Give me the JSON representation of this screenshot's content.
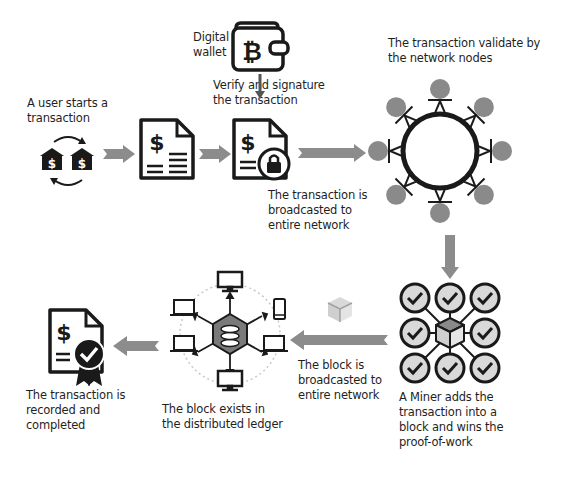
{
  "colors": {
    "arrow": "#8c8c8c",
    "icon_stroke": "#1a1a1a",
    "node_fill": "#8a8a8a",
    "check_fill": "#d9d9d9",
    "cube_fill": "#bfbfbf",
    "ledger_hex": "#7a7a7a",
    "dotted_ring": "#c8c8c8"
  },
  "steps": [
    {
      "id": "start",
      "label": "A user starts a\ntransaction",
      "icon": "bank-exchange-icon"
    },
    {
      "id": "invoice",
      "icon": "invoice-document-icon"
    },
    {
      "id": "signed",
      "icon": "locked-document-icon"
    },
    {
      "id": "wallet",
      "label": "Digital\nwallet",
      "icon": "bitcoin-wallet-icon"
    },
    {
      "id": "verify",
      "label": "Verify and signature\nthe transaction"
    },
    {
      "id": "broadcast_tx",
      "label": "The transaction is\nbroadcasted to\nentire network"
    },
    {
      "id": "validate",
      "label": "The transaction validate by\nthe network nodes",
      "icon": "network-ring-icon"
    },
    {
      "id": "miner",
      "label": "A Miner adds the\ntransaction into a\nblock and wins the\nproof-of-work",
      "icon": "mining-grid-icon"
    },
    {
      "id": "broadcast_block",
      "label": "The block is\nbroadcasted to\nentire network",
      "icon": "block-cube-icon"
    },
    {
      "id": "ledger",
      "label": "The block exists in\nthe distributed ledger",
      "icon": "distributed-ledger-icon"
    },
    {
      "id": "complete",
      "label": "The transaction is\nrecorded and\ncompleted",
      "icon": "certified-document-icon"
    }
  ]
}
